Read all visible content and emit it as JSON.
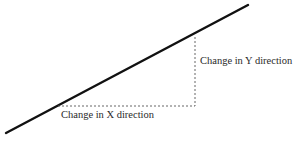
{
  "diagram": {
    "type": "slope-illustration",
    "labels": {
      "y_change": "Change in Y direction",
      "x_change": "Change in X direction"
    },
    "colors": {
      "line": "#111111",
      "dashed": "#555555",
      "text": "#2a2a2a",
      "background": "#ffffff"
    }
  }
}
